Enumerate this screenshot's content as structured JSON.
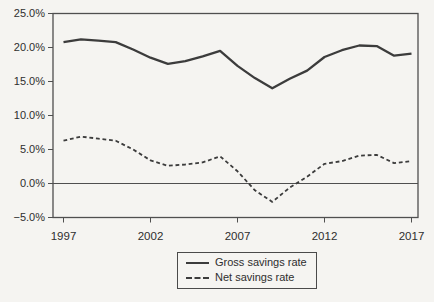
{
  "chart_data": {
    "type": "line",
    "title": "",
    "xlabel": "",
    "ylabel": "",
    "x": [
      1997,
      1998,
      1999,
      2000,
      2001,
      2002,
      2003,
      2004,
      2005,
      2006,
      2007,
      2008,
      2009,
      2010,
      2011,
      2012,
      2013,
      2014,
      2015,
      2016,
      2017
    ],
    "series": [
      {
        "name": "Gross savings rate",
        "style": "solid",
        "values": [
          20.8,
          21.2,
          21.0,
          20.8,
          19.7,
          18.5,
          17.6,
          18.0,
          18.7,
          19.5,
          17.3,
          15.5,
          14.0,
          15.4,
          16.6,
          18.6,
          19.6,
          20.3,
          20.2,
          18.8,
          19.1
        ]
      },
      {
        "name": "Net savings rate",
        "style": "dashed",
        "values": [
          6.3,
          6.9,
          6.6,
          6.3,
          5.0,
          3.4,
          2.6,
          2.8,
          3.1,
          4.0,
          1.8,
          -1.0,
          -2.7,
          -0.6,
          1.0,
          2.9,
          3.3,
          4.1,
          4.2,
          3.0,
          3.3
        ]
      }
    ],
    "xlim": [
      1997,
      2017
    ],
    "ylim": [
      -5,
      25
    ],
    "y_ticks": [
      25,
      20,
      15,
      10,
      5,
      0,
      -5
    ],
    "y_tick_labels": [
      "25.0%",
      "20.0%",
      "15.0%",
      "10.0%",
      "5.0%",
      "0.0%",
      "−5.0%"
    ],
    "x_ticks": [
      1997,
      2002,
      2007,
      2012,
      2017
    ],
    "x_tick_labels": [
      "1997",
      "2002",
      "2007",
      "2012",
      "2017"
    ],
    "zero_line": true,
    "grid": false,
    "legend_position": "bottom-center",
    "line_color": "#3c3c3c",
    "axis_color": "#4f4f4f",
    "text_color": "#2e2e2e",
    "background": "#f5f4f1"
  }
}
